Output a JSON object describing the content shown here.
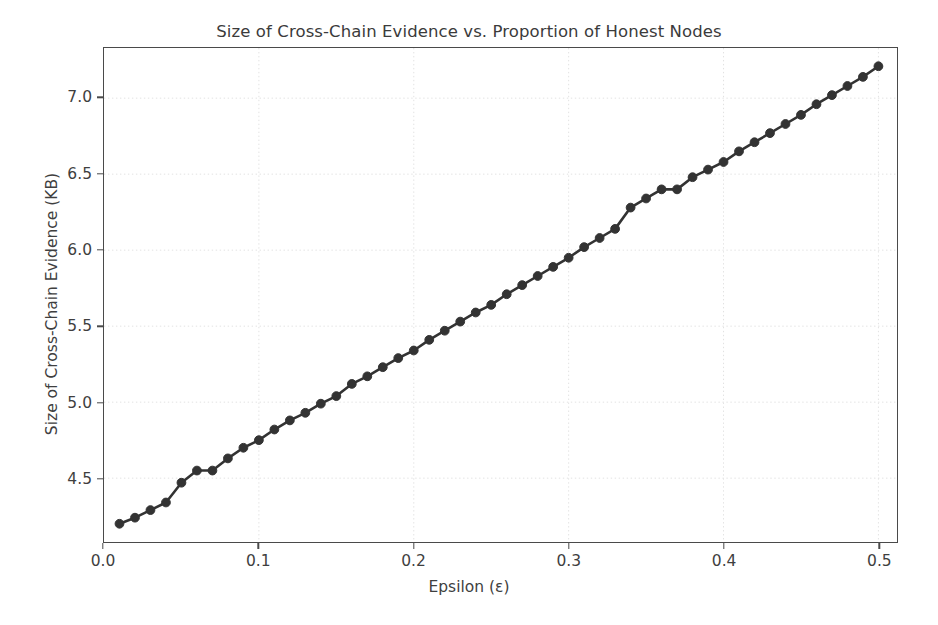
{
  "chart_data": {
    "type": "line",
    "title": "Size of Cross-Chain Evidence vs. Proportion of Honest Nodes",
    "xlabel": "Epsilon (ε)",
    "ylabel": "Size of Cross-Chain Evidence (KB)",
    "xlim": [
      0.0,
      0.512
    ],
    "ylim": [
      4.08,
      7.33
    ],
    "xticks": [
      "0.0",
      "0.1",
      "0.2",
      "0.3",
      "0.4",
      "0.5"
    ],
    "xtick_values": [
      0.0,
      0.1,
      0.2,
      0.3,
      0.4,
      0.5
    ],
    "yticks": [
      "4.5",
      "5.0",
      "5.5",
      "6.0",
      "6.5",
      "7.0"
    ],
    "ytick_values": [
      4.5,
      5.0,
      5.5,
      6.0,
      6.5,
      7.0
    ],
    "grid": true,
    "grid_style": "dotted",
    "grid_color": "#e2e2e2",
    "legend": null,
    "marker": "circle",
    "marker_color": "#333333",
    "line_color": "#333333",
    "series": [
      {
        "name": "Size of Cross-Chain Evidence (KB)",
        "x": [
          0.01,
          0.02,
          0.03,
          0.04,
          0.05,
          0.06,
          0.07,
          0.08,
          0.09,
          0.1,
          0.11,
          0.12,
          0.13,
          0.14,
          0.15,
          0.16,
          0.17,
          0.18,
          0.19,
          0.2,
          0.21,
          0.22,
          0.23,
          0.24,
          0.25,
          0.26,
          0.27,
          0.28,
          0.29,
          0.3,
          0.31,
          0.32,
          0.33,
          0.34,
          0.35,
          0.36,
          0.37,
          0.38,
          0.39,
          0.4,
          0.41,
          0.42,
          0.43,
          0.44,
          0.45,
          0.46,
          0.47,
          0.48,
          0.49,
          0.5
        ],
        "y": [
          4.2,
          4.24,
          4.29,
          4.34,
          4.47,
          4.55,
          4.55,
          4.63,
          4.7,
          4.75,
          4.82,
          4.88,
          4.93,
          4.99,
          5.04,
          5.12,
          5.17,
          5.23,
          5.29,
          5.34,
          5.41,
          5.47,
          5.53,
          5.59,
          5.64,
          5.71,
          5.77,
          5.83,
          5.89,
          5.95,
          6.02,
          6.08,
          6.14,
          6.28,
          6.34,
          6.4,
          6.4,
          6.48,
          6.53,
          6.58,
          6.65,
          6.71,
          6.77,
          6.83,
          6.89,
          6.96,
          7.02,
          7.08,
          7.14,
          7.21
        ]
      }
    ]
  }
}
